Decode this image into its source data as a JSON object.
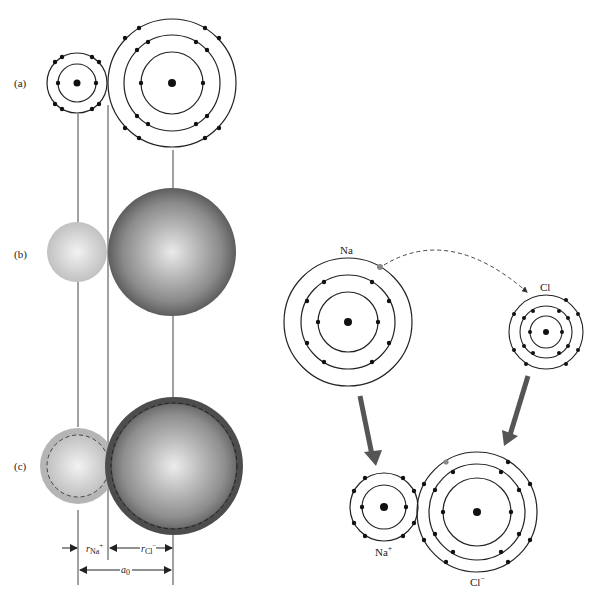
{
  "figure": {
    "panel_labels": {
      "a": "(a)",
      "b": "(b)",
      "c": "(c)"
    },
    "dimension_labels": {
      "r_na": "r",
      "r_na_sub": "Na",
      "r_na_sup": "+",
      "r_cl": "r",
      "r_cl_sub": "Cl",
      "r_cl_sup": "−",
      "a0": "a",
      "a0_sub": "0"
    },
    "right_diagram": {
      "na_label": "Na",
      "cl_label": "Cl",
      "na_ion_label": "Na",
      "na_ion_sup": "+",
      "cl_ion_label": "Cl",
      "cl_ion_sup": "−"
    },
    "colors": {
      "line": "#222222",
      "arrow": "#555555",
      "transferred_electron": "#888888",
      "sphere_small_light": "#eeeeee",
      "sphere_small_dark": "#bdbdbd",
      "sphere_large_light": "#e8e8e8",
      "sphere_large_dark": "#4a4a4a"
    }
  }
}
